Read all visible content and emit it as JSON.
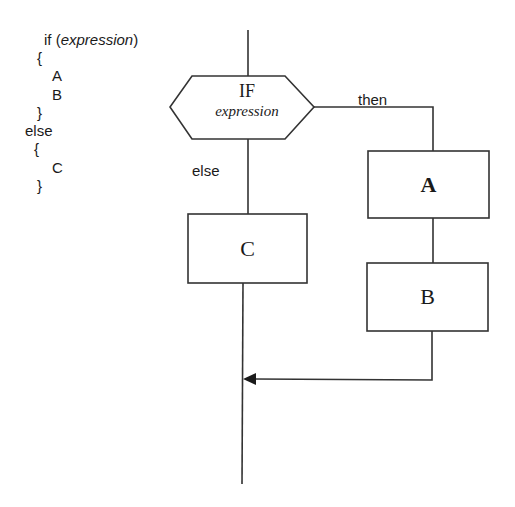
{
  "code": {
    "lines": [
      {
        "text_pre": "if (",
        "text_it": "expression",
        "text_post": ")"
      },
      {
        "text": "{"
      },
      {
        "text": "A"
      },
      {
        "text": "B"
      },
      {
        "text": "}"
      },
      {
        "text": "else"
      },
      {
        "text": "{"
      },
      {
        "text": "C"
      },
      {
        "text": "}"
      }
    ]
  },
  "flowchart": {
    "decision": {
      "title": "IF",
      "subtitle": "expression"
    },
    "branch_then_label": "then",
    "branch_else_label": "else",
    "boxes": {
      "a": "A",
      "b": "B",
      "c": "C"
    },
    "stroke_color": "#333333"
  }
}
